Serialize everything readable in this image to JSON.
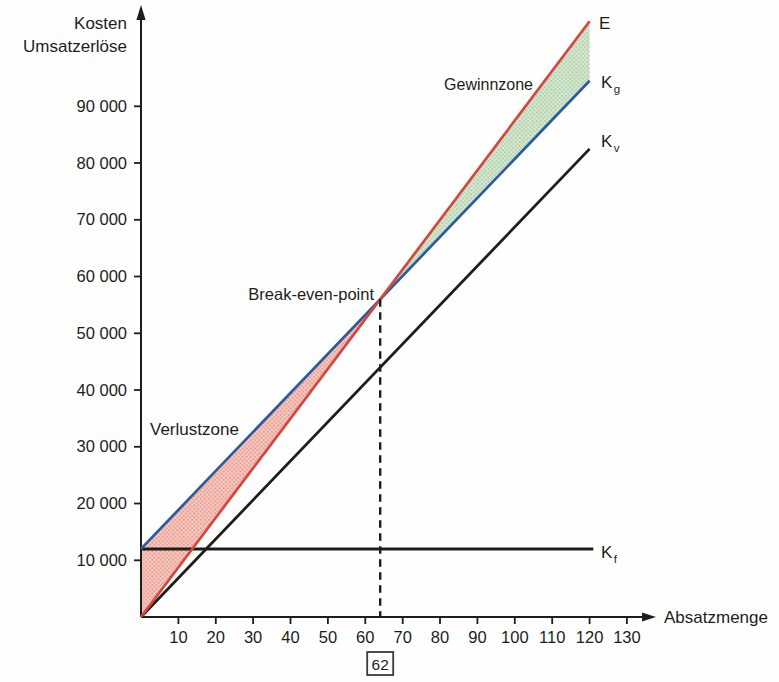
{
  "chart_data": {
    "type": "line",
    "xlabel": "Absatzmenge",
    "ylabel_lines": [
      "Kosten",
      "Umsatzerlöse"
    ],
    "xlim": [
      0,
      136
    ],
    "ylim": [
      0,
      107000
    ],
    "grid": false,
    "axis_color": "#1d1d1b",
    "x_ticks": [
      10,
      20,
      30,
      40,
      50,
      60,
      70,
      80,
      90,
      100,
      110,
      120,
      130
    ],
    "y_ticks": [
      {
        "value": 10000,
        "label": "10 000"
      },
      {
        "value": 20000,
        "label": "20 000"
      },
      {
        "value": 30000,
        "label": "30 000"
      },
      {
        "value": 40000,
        "label": "40 000"
      },
      {
        "value": 50000,
        "label": "50 000"
      },
      {
        "value": 60000,
        "label": "60 000"
      },
      {
        "value": 70000,
        "label": "70 000"
      },
      {
        "value": 80000,
        "label": "80 000"
      },
      {
        "value": 90000,
        "label": "90 000"
      }
    ],
    "series": [
      {
        "id": "E",
        "label": "E",
        "label_sub": "",
        "color": "#d5473c",
        "points": [
          [
            0,
            0
          ],
          [
            120,
            105000
          ]
        ]
      },
      {
        "id": "Kg",
        "label": "K",
        "label_sub": "g",
        "color": "#2b5a9e",
        "points": [
          [
            0,
            12000
          ],
          [
            120,
            94500
          ]
        ]
      },
      {
        "id": "Kv",
        "label": "K",
        "label_sub": "v",
        "color": "#1d1d1b",
        "points": [
          [
            0,
            0
          ],
          [
            120,
            82500
          ]
        ]
      },
      {
        "id": "Kf",
        "label": "K",
        "label_sub": "f",
        "color": "#1d1d1b",
        "points": [
          [
            0,
            12000
          ],
          [
            121,
            12000
          ]
        ]
      }
    ],
    "break_even": {
      "label": "Break-even-point",
      "x_axis_label": "62",
      "between": [
        "E",
        "Kg"
      ]
    },
    "zones": [
      {
        "id": "verlust",
        "label": "Verlustzone",
        "text_color": "#d5473c",
        "fill_bg": "#f6c9c1",
        "fill_dot": "#e49183",
        "range": "before_break_even",
        "between": [
          "Kg",
          "E"
        ]
      },
      {
        "id": "gewinn",
        "label": "Gewinnzone",
        "text_color": "#44a24a",
        "fill_bg": "#d6e7d1",
        "fill_dot": "#a6cba1",
        "range": "after_break_even",
        "between": [
          "E",
          "Kg"
        ]
      }
    ]
  }
}
